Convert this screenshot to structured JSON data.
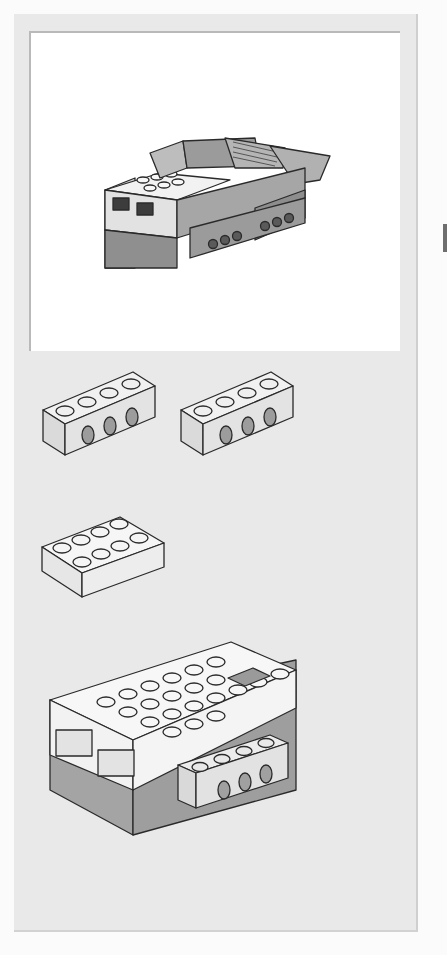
{
  "page": {
    "type": "building-instruction-step",
    "background": "#fbfbfb",
    "panel_color": "#e9e9e9",
    "frame_color": "#ffffff"
  },
  "model_preview": {
    "label": "completed model",
    "colors": {
      "dark": "#8a8a8a",
      "mid": "#a9a9a9",
      "light": "#d6d6d6",
      "white": "#f4f4f4"
    }
  },
  "parts_list": [
    {
      "name": "technic-brick-1x4-with-holes",
      "count": 1,
      "color": "#e2e2e2"
    },
    {
      "name": "technic-brick-1x4-with-holes",
      "count": 1,
      "color": "#e2e2e2"
    },
    {
      "name": "brick-2x4",
      "count": 1,
      "color": "#f0f0f0"
    }
  ],
  "assembly": {
    "label": "smarthub with technic brick attached",
    "hub_top_color": "#f5f5f5",
    "hub_bottom_color": "#a3a3a3",
    "button_color": "#9a9a9a"
  }
}
